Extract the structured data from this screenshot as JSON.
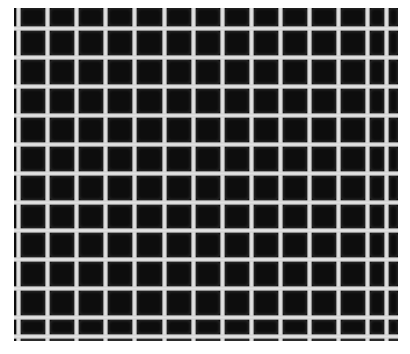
{
  "image": {
    "description": "Grayscale micrograph of a square mesh grid: bright grey lines on a black background",
    "subject": "square-mesh-grid",
    "photo_bounds": {
      "left": 14,
      "top": 8,
      "right": 398,
      "bottom": 341
    },
    "colors": {
      "background_page": "#ffffff",
      "cell": "#0d0d0d",
      "grid_line": "#d8d8d8"
    },
    "grid": {
      "vertical_lines_x": [
        18,
        47,
        76,
        105,
        134,
        164,
        193,
        222,
        251,
        280,
        309,
        338,
        367,
        386
      ],
      "horizontal_lines_y": [
        28,
        57,
        86,
        115,
        144,
        173,
        202,
        230,
        259,
        288,
        317,
        336
      ],
      "line_width": 5,
      "pitch": 29,
      "columns_visible": 13,
      "rows_visible": 12
    }
  }
}
